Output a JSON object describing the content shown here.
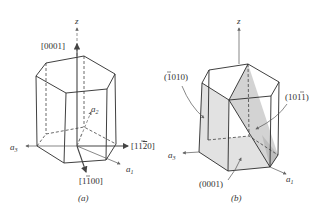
{
  "figure": {
    "panel_a": {
      "caption": "(a)",
      "axes": {
        "z": "z",
        "a1": "a",
        "a1_sub": "1",
        "a2": "a",
        "a2_sub": "2",
        "a3": "a",
        "a3_sub": "3"
      },
      "directions": {
        "c_axis": "[0001]",
        "d1_prefix": "[11",
        "d1_bar": "2",
        "d1_suffix": "0]",
        "d2_prefix": "[1",
        "d2_bar": "1",
        "d2_suffix": "00]"
      }
    },
    "panel_b": {
      "caption": "(b)",
      "axes": {
        "z": "z",
        "a1": "a",
        "a1_sub": "1",
        "a3": "a",
        "a3_sub": "3"
      },
      "planes": {
        "prism_prefix": "(",
        "prism_bar": "1",
        "prism_suffix": "010)",
        "pyramidal_prefix": "(10",
        "pyramidal_bar": "1",
        "pyramidal_suffix": "1)",
        "basal": "(0001)"
      }
    },
    "colors": {
      "line": "#2a2a2a",
      "shade": "#d3d3d3",
      "background": "#ffffff"
    }
  }
}
